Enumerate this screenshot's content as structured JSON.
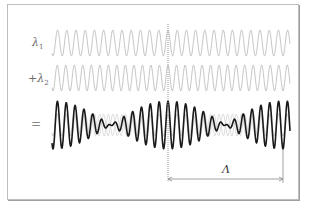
{
  "diagram": {
    "labels": {
      "wave1_symbol": "λ",
      "wave1_subscript": "1",
      "wave2_prefix": "+",
      "wave2_symbol": "λ",
      "wave2_subscript": "2",
      "equals": "=",
      "beat_length": "Λ"
    },
    "waves": {
      "wave1": {
        "cycles": 24,
        "color": "#b8b8b8"
      },
      "wave2": {
        "cycles": 26,
        "color": "#b8b8b8"
      },
      "sum": {
        "color": "#1a1a1a",
        "beats": 2
      }
    },
    "colors": {
      "frame": "#bdbdbd",
      "guide_line": "#9a9a9a",
      "dimension_line": "#8a8a8a"
    }
  }
}
